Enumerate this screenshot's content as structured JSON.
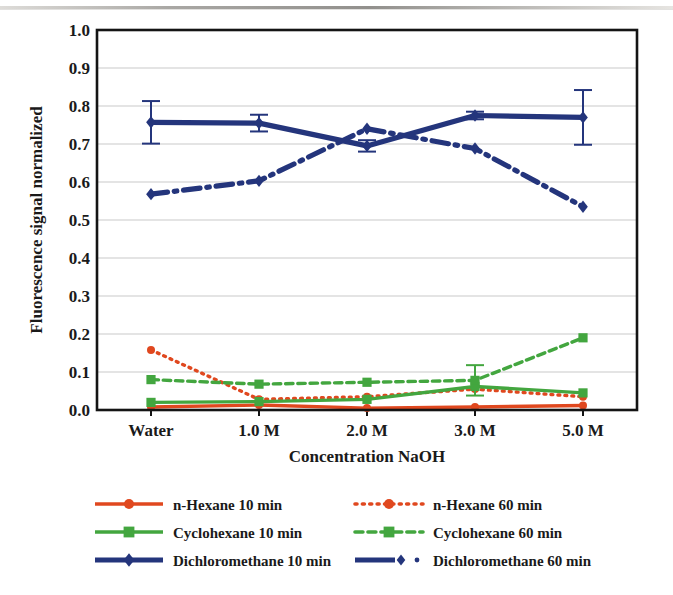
{
  "figure": {
    "title": "",
    "axis": {
      "ylabel": "Fluorescence signal normalized",
      "xlabel": "Concentration NaOH",
      "yticks": [
        "0.0",
        "0.1",
        "0.2",
        "0.3",
        "0.4",
        "0.5",
        "0.6",
        "0.7",
        "0.8",
        "0.9",
        "1.0"
      ],
      "xticks": [
        "Water",
        "1.0 M",
        "2.0 M",
        "3.0 M",
        "5.0 M"
      ]
    },
    "legend": {
      "items": [
        {
          "label": "n-Hexane 10 min",
          "color": "#E0481F",
          "style": "solid",
          "marker": "circle"
        },
        {
          "label": "n-Hexane 60 min",
          "color": "#E0481F",
          "style": "dotted",
          "marker": "circle"
        },
        {
          "label": "Cyclohexane 10 min",
          "color": "#43A63F",
          "style": "solid",
          "marker": "square"
        },
        {
          "label": "Cyclohexane 60 min",
          "color": "#43A63F",
          "style": "dashed",
          "marker": "square"
        },
        {
          "label": "Dichloromethane 10 min",
          "color": "#24357C",
          "style": "solid",
          "marker": "diamond"
        },
        {
          "label": "Dichloromethane 60 min",
          "color": "#24357C",
          "style": "dashdot",
          "marker": "diamond"
        }
      ]
    },
    "colors": {
      "hexane": "#E0481F",
      "cyclohexane": "#43A63F",
      "dichloromethane": "#24357C",
      "grid": "#c9c9c9",
      "frame": "#141414",
      "background": "#ffffff"
    }
  },
  "chart_data": {
    "type": "line",
    "title": "",
    "xlabel": "Concentration NaOH",
    "ylabel": "Fluorescence signal normalized",
    "categories": [
      "Water",
      "1.0 M",
      "2.0 M",
      "3.0 M",
      "5.0 M"
    ],
    "ylim": [
      0.0,
      1.0
    ],
    "ytick_step": 0.1,
    "grid": true,
    "legend_position": "bottom",
    "series": [
      {
        "name": "n-Hexane 10 min",
        "color": "#E0481F",
        "linestyle": "solid",
        "marker": "circle",
        "values": [
          0.008,
          0.013,
          0.005,
          0.008,
          0.012
        ],
        "errors": [
          0.0,
          0.0,
          0.0,
          0.0,
          0.0
        ]
      },
      {
        "name": "n-Hexane 60 min",
        "color": "#E0481F",
        "linestyle": "dotted",
        "marker": "circle",
        "values": [
          0.158,
          0.028,
          0.035,
          0.055,
          0.035
        ],
        "errors": [
          0.0,
          0.0,
          0.0,
          0.0,
          0.0
        ]
      },
      {
        "name": "Cyclohexane 10 min",
        "color": "#43A63F",
        "linestyle": "solid",
        "marker": "square",
        "values": [
          0.02,
          0.022,
          0.028,
          0.062,
          0.045
        ],
        "errors": [
          0.0,
          0.0,
          0.0,
          0.0,
          0.0
        ]
      },
      {
        "name": "Cyclohexane 60 min",
        "color": "#43A63F",
        "linestyle": "dashed",
        "marker": "square",
        "values": [
          0.08,
          0.068,
          0.073,
          0.078,
          0.19
        ],
        "errors": [
          0.0,
          0.0,
          0.0,
          0.04,
          0.0
        ]
      },
      {
        "name": "Dichloromethane 10 min",
        "color": "#24357C",
        "linestyle": "solid",
        "marker": "diamond",
        "values": [
          0.757,
          0.755,
          0.695,
          0.775,
          0.77
        ],
        "errors": [
          0.056,
          0.022,
          0.015,
          0.01,
          0.072
        ]
      },
      {
        "name": "Dichloromethane 60 min",
        "color": "#24357C",
        "linestyle": "dashdot",
        "marker": "diamond",
        "values": [
          0.568,
          0.603,
          0.74,
          0.688,
          0.535
        ],
        "errors": [
          0.0,
          0.0,
          0.0,
          0.0,
          0.0
        ]
      }
    ]
  }
}
